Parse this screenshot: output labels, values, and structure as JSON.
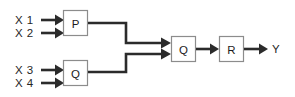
{
  "diagram": {
    "type": "block-diagram",
    "background_color": "#ffffff",
    "wire_color": "#2b2b2b",
    "block_border_color": "#8c8c8c",
    "block_fill_color": "#ffffff",
    "text_color": "#262626",
    "inputs": [
      {
        "label": "X 1",
        "target": "block-p"
      },
      {
        "label": "X 2",
        "target": "block-p"
      },
      {
        "label": "X 3",
        "target": "block-q-lower"
      },
      {
        "label": "X 4",
        "target": "block-q-lower"
      }
    ],
    "blocks": [
      {
        "id": "block-p",
        "label": "P"
      },
      {
        "id": "block-q-lower",
        "label": "Q"
      },
      {
        "id": "block-q-mid",
        "label": "Q"
      },
      {
        "id": "block-r",
        "label": "R"
      }
    ],
    "outputs": [
      {
        "label": "Y",
        "source": "block-r"
      }
    ],
    "connections": [
      {
        "from": "block-p",
        "to": "block-q-mid"
      },
      {
        "from": "block-q-lower",
        "to": "block-q-mid"
      },
      {
        "from": "block-q-mid",
        "to": "block-r"
      },
      {
        "from": "block-r",
        "to": "output-y"
      }
    ]
  }
}
